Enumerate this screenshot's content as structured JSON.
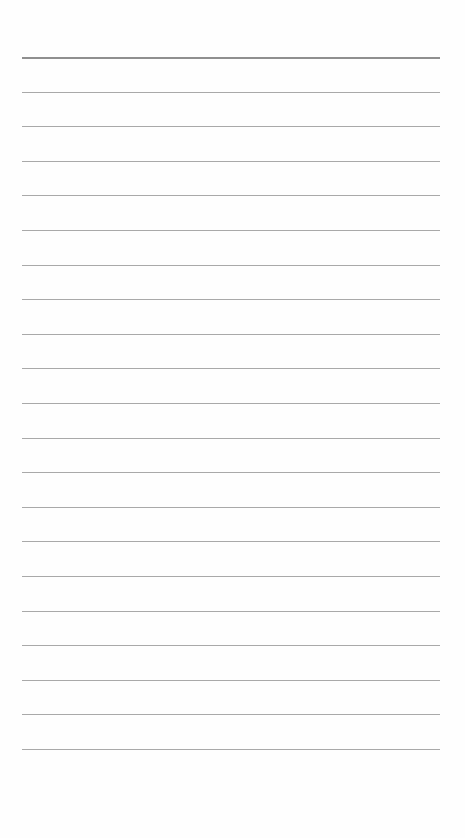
{
  "page": {
    "type": "lined-paper",
    "background": "#fefefe",
    "rule_color": "#a9a9a9",
    "top_rule_color": "#8f8f8f",
    "rule_count": 21,
    "first_rule_y": 57,
    "rule_spacing": 34.6,
    "rule_left": 22,
    "rule_width": 418,
    "text_lines": []
  }
}
